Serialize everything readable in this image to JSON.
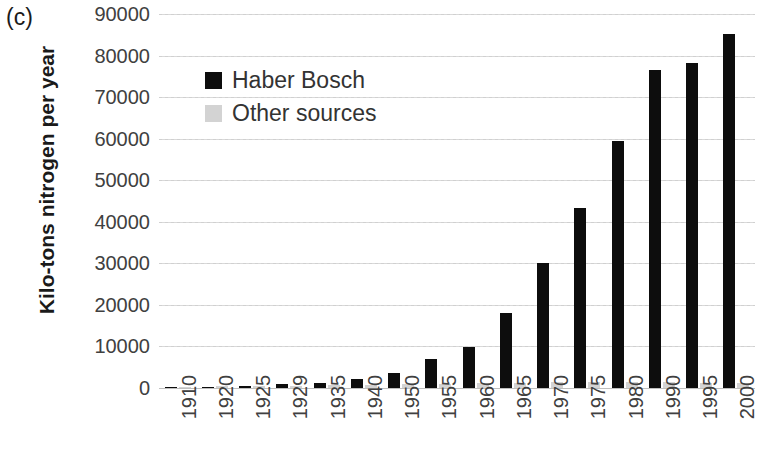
{
  "panel": {
    "label": "(c)"
  },
  "axes": {
    "y_title": "Kilo-tons nitrogen per year",
    "y_ticks": [
      "90000",
      "80000",
      "70000",
      "60000",
      "50000",
      "40000",
      "30000",
      "20000",
      "10000",
      "0"
    ]
  },
  "legend": {
    "items": [
      {
        "label": "Haber Bosch",
        "color": "#0d0d0d"
      },
      {
        "label": "Other sources",
        "color": "#d3d3d3"
      }
    ]
  },
  "chart_data": {
    "type": "bar",
    "title": "",
    "subtitle": "",
    "panel_label": "(c)",
    "xlabel": "",
    "ylabel": "Kilo-tons nitrogen per year",
    "ylim": [
      0,
      90000
    ],
    "ytick_step": 10000,
    "grid": true,
    "legend_position": "upper-left-inside",
    "grouping": "grouped",
    "categories": [
      "1910",
      "1920",
      "1925",
      "1929",
      "1935",
      "1940",
      "1950",
      "1955",
      "1960",
      "1965",
      "1970",
      "1975",
      "1980",
      "1990",
      "1995",
      "2000"
    ],
    "series": [
      {
        "name": "Haber Bosch",
        "color": "#0d0d0d",
        "values": [
          100,
          300,
          600,
          900,
          1200,
          2200,
          3700,
          7000,
          9800,
          18000,
          30000,
          43300,
          59500,
          76500,
          78300,
          85200
        ]
      },
      {
        "name": "Other sources",
        "color": "#d3d3d3",
        "values": [
          300,
          400,
          500,
          600,
          700,
          800,
          900,
          1000,
          1200,
          1300,
          1400,
          1400,
          1500,
          1400,
          1300,
          1200
        ]
      }
    ]
  }
}
